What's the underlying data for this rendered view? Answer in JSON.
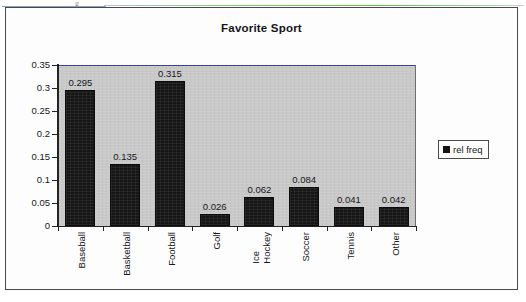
{
  "chart_data": {
    "type": "bar",
    "title": "Favorite Sport",
    "xlabel": "",
    "ylabel": "",
    "categories": [
      "Baseball",
      "Basketball",
      "Football",
      "Golf",
      "Ice\nHockey",
      "Soccer",
      "Tennis",
      "Other"
    ],
    "values": [
      0.295,
      0.135,
      0.315,
      0.026,
      0.062,
      0.084,
      0.041,
      0.042
    ],
    "value_labels": [
      "0.295",
      "0.135",
      "0.315",
      "0.026",
      "0.062",
      "0.084",
      "0.041",
      "0.042"
    ],
    "series": [
      {
        "name": "rel freq",
        "values": [
          0.295,
          0.135,
          0.315,
          0.026,
          0.062,
          0.084,
          0.041,
          0.042
        ]
      }
    ],
    "ylim": [
      0,
      0.35
    ],
    "ytick_labels": [
      "0.35",
      "0.3",
      "0.25",
      "0.2",
      "0.15",
      "0.1",
      "0.05",
      "0"
    ],
    "ytick_values": [
      0.35,
      0.3,
      0.25,
      0.2,
      0.15,
      0.1,
      0.05,
      0
    ],
    "grid": false,
    "legend": {
      "position": "right",
      "entries": [
        {
          "label": "rel freq",
          "swatch": "legend-swatch-icon",
          "color": "#141414"
        }
      ]
    },
    "colors": {
      "bar": "#161616",
      "plot_background": "#c9c9c9",
      "axis": "#232326",
      "plot_top_border": "#3b3fa0",
      "frame": "#4a4a4a",
      "text": "#16161a"
    }
  },
  "artifacts": {
    "top_smudge": "g"
  }
}
